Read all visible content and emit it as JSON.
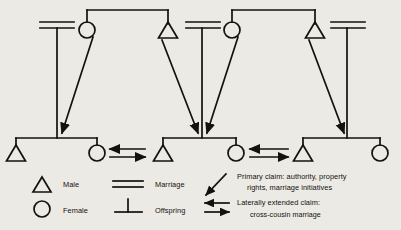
{
  "diagram": {
    "stroke_color": "#14110e",
    "background_color": "#eceae4",
    "generations": [
      {
        "name": "parent-generation",
        "groups": [
          {
            "id": "group-a",
            "marriage_symbol": "marriage-a",
            "members": [
              {
                "type": "female",
                "label": "Female",
                "x": 87,
                "y": 30
              },
              {
                "type": "male",
                "label": "Male",
                "x": 168,
                "y": 30
              }
            ]
          },
          {
            "id": "group-b",
            "marriage_symbol": "marriage-b",
            "members": [
              {
                "type": "female",
                "label": "Female",
                "x": 232,
                "y": 30
              },
              {
                "type": "male",
                "label": "Male",
                "x": 315,
                "y": 30
              }
            ]
          }
        ]
      },
      {
        "name": "child-generation",
        "groups": [
          {
            "id": "sibship-1",
            "members": [
              {
                "type": "male",
                "label": "Male",
                "x": 16,
                "y": 152
              },
              {
                "type": "female",
                "label": "Female",
                "x": 97,
                "y": 152
              }
            ]
          },
          {
            "id": "sibship-2",
            "members": [
              {
                "type": "male",
                "label": "Male",
                "x": 163,
                "y": 152
              },
              {
                "type": "female",
                "label": "Female",
                "x": 236,
                "y": 152
              }
            ]
          },
          {
            "id": "sibship-3",
            "members": [
              {
                "type": "male",
                "label": "Male",
                "x": 303,
                "y": 152
              },
              {
                "type": "female",
                "label": "Female",
                "x": 380,
                "y": 152
              }
            ]
          }
        ]
      }
    ],
    "marriage_symbols": [
      {
        "id": "marriage-a",
        "x": 57,
        "y": 25
      },
      {
        "id": "marriage-b",
        "x": 202,
        "y": 25
      },
      {
        "id": "marriage-c",
        "x": 347,
        "y": 25
      }
    ],
    "primary_claim_arrows": [
      {
        "from": "female-a",
        "to": "sibship-1"
      },
      {
        "from": "male-a",
        "to": "sibship-2"
      },
      {
        "from": "female-b",
        "to": "sibship-2"
      },
      {
        "from": "male-b",
        "to": "sibship-3"
      }
    ],
    "lateral_claim_arrows": [
      {
        "between": [
          "sibship-1-female",
          "sibship-2-male"
        ]
      },
      {
        "between": [
          "sibship-2-female",
          "sibship-3-male"
        ]
      }
    ]
  },
  "legend": {
    "symbols": [
      {
        "icon": "triangle-icon",
        "label": "Male"
      },
      {
        "icon": "circle-icon",
        "label": "Female"
      },
      {
        "icon": "double-line-icon",
        "label": "Marriage"
      },
      {
        "icon": "tee-icon",
        "label": "Offspring"
      }
    ],
    "arrows": [
      {
        "icon": "diagonal-arrow-icon",
        "line1": "Primary claim: authority, property",
        "line2": "rights, marriage initiatives"
      },
      {
        "icon": "double-arrow-icon",
        "line1": "Laterally extended claim:",
        "line2": "cross-cousin marriage"
      }
    ]
  }
}
